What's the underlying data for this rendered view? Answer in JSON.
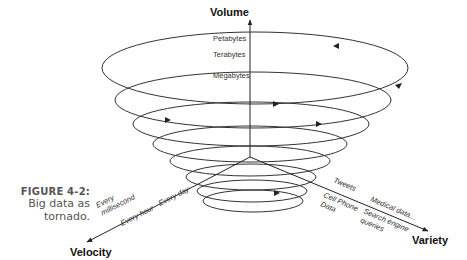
{
  "caption": {
    "figure": "FIGURE 4-2:",
    "lines": [
      "Big data as",
      "tornado."
    ]
  },
  "axes": {
    "volume": "Volume",
    "velocity": "Velocity",
    "variety": "Variety"
  },
  "volume_labels": [
    "Petabytes",
    "Terabytes",
    "Megabytes"
  ],
  "velocity_labels": [
    "Every",
    "millisecond",
    "Every hour",
    "Every day"
  ],
  "variety_labels": [
    "Tweets",
    "Cell Phone",
    "Data",
    "Medical data...",
    "Search engine",
    "queries"
  ],
  "colors": {
    "line": "#333333",
    "text": "#333333",
    "caption": "#555555"
  },
  "spiral": {
    "loops": [
      {
        "cx": 255,
        "cy": 68,
        "rx": 153,
        "ry": 36
      },
      {
        "cx": 253,
        "cy": 100,
        "rx": 138,
        "ry": 28
      },
      {
        "cx": 251,
        "cy": 124,
        "rx": 118,
        "ry": 22
      },
      {
        "cx": 250,
        "cy": 144,
        "rx": 97,
        "ry": 18
      },
      {
        "cx": 250,
        "cy": 161,
        "rx": 80,
        "ry": 15
      },
      {
        "cx": 251,
        "cy": 177,
        "rx": 65,
        "ry": 13
      },
      {
        "cx": 252,
        "cy": 191,
        "rx": 55,
        "ry": 11
      },
      {
        "cx": 253,
        "cy": 201,
        "rx": 50,
        "ry": 11
      }
    ]
  }
}
